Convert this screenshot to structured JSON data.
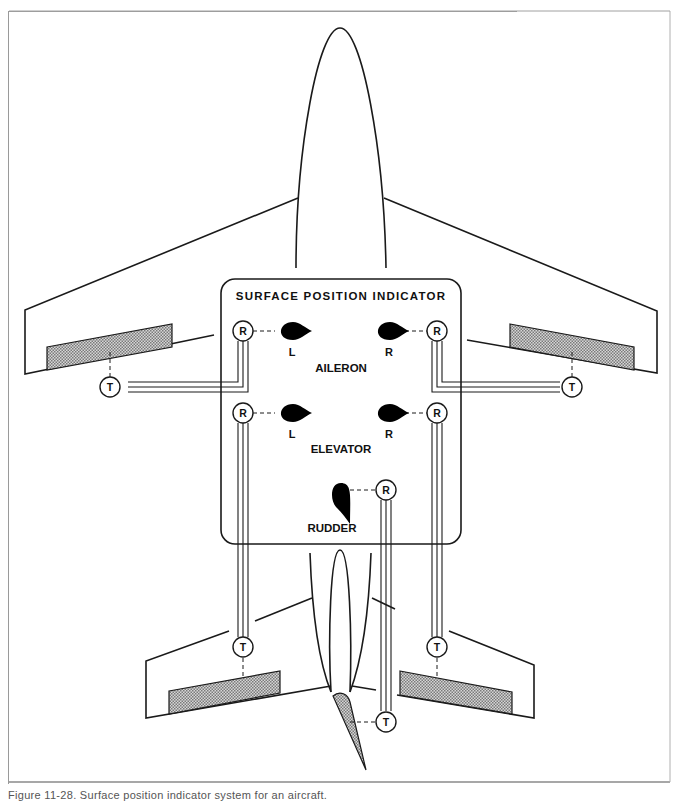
{
  "figure": {
    "title": "SURFACE POSITION INDICATOR",
    "caption": "Figure 11-28. Surface position indicator system for an aircraft."
  },
  "indicator_panel": {
    "title": "SURFACE POSITION INDICATOR",
    "groups": [
      {
        "name": "AILERON",
        "pointers": [
          {
            "side": "L"
          },
          {
            "side": "R"
          }
        ]
      },
      {
        "name": "ELEVATOR",
        "pointers": [
          {
            "side": "L"
          },
          {
            "side": "R"
          }
        ]
      },
      {
        "name": "RUDDER",
        "pointers": [
          {
            "side": ""
          }
        ]
      }
    ]
  },
  "labels": {
    "aileron": "AILERON",
    "elevator": "ELEVATOR",
    "rudder": "RUDDER",
    "left": "L",
    "right": "R",
    "receiver": "R",
    "transmitter": "T"
  },
  "components": {
    "receivers": 5,
    "transmitters": 5
  },
  "colors": {
    "line": "#1a1a1a",
    "fill_pointer": "#000000",
    "hatch": "#bcbcbc",
    "frame": "#9a9a9a"
  }
}
